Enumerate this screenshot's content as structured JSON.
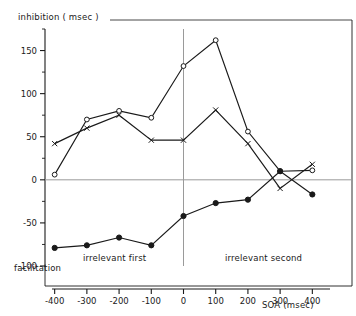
{
  "figure": {
    "ylabel_top": "inhibition ( msec )",
    "ylabel_bottom": "facilitation",
    "xlabel": "SOA (msec)",
    "region_left_label": "irrelevant first",
    "region_right_label": "irrelevant second",
    "axis_color": "#1a1a1a",
    "zero_line_color": "#9a9a9a",
    "divider_color": "#9a9a9a",
    "series_color": "#1a1a1a"
  },
  "chart_data": {
    "type": "line",
    "title": "",
    "subtitle": "",
    "xlabel": "SOA (msec)",
    "ylabel": "inhibition ( msec )",
    "x": [
      -400,
      -300,
      -200,
      -100,
      0,
      100,
      200,
      300,
      400
    ],
    "xticks": [
      "-400",
      "-300",
      "-200",
      "-100",
      "0",
      "100",
      "200",
      "300",
      "400"
    ],
    "yticks": [
      "150",
      "100",
      "50",
      "0",
      "-50",
      "-100"
    ],
    "ytick_values": [
      150,
      100,
      50,
      0,
      -50,
      -100
    ],
    "xlim": [
      -430,
      430
    ],
    "ylim": [
      -100,
      175
    ],
    "grid": false,
    "legend": "none",
    "zero_line": 0,
    "divider_x": 0,
    "annotations": [
      {
        "text": "irrelevant first",
        "x": -200,
        "y": -95
      },
      {
        "text": "irrelevant second",
        "x": 200,
        "y": -95
      },
      {
        "text": "inhibition ( msec )",
        "position": "top-left-outside"
      },
      {
        "text": "facilitation",
        "position": "bottom-left-outside"
      }
    ],
    "series": [
      {
        "name": "open-circle",
        "marker": "circle-open",
        "values": [
          6,
          70,
          80,
          72,
          132,
          162,
          56,
          10,
          11
        ]
      },
      {
        "name": "cross",
        "marker": "cross",
        "values": [
          42,
          60,
          75,
          46,
          46,
          81,
          42,
          -10,
          18
        ]
      },
      {
        "name": "filled-circle",
        "marker": "circle-filled",
        "values": [
          -79,
          -76,
          -67,
          -76,
          -42,
          -27,
          -23,
          10,
          -17
        ]
      }
    ]
  }
}
